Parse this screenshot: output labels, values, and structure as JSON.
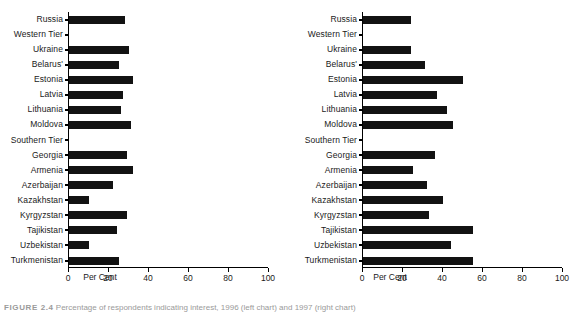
{
  "figure": {
    "caption_label": "FIGURE 2.4",
    "caption_text": "Percentage of respondents indicating interest, 1996 (left chart) and 1997 (right chart)"
  },
  "chart_data": [
    {
      "type": "bar",
      "orientation": "horizontal",
      "title": "",
      "xlabel": "Per Cent",
      "ylabel": "",
      "xlim": [
        0,
        100
      ],
      "xticks": [
        0,
        20,
        40,
        60,
        80,
        100
      ],
      "grid": false,
      "legend": "none",
      "categories": [
        "Russia",
        "Western Tier",
        "Ukraine",
        "Belarus'",
        "Estonia",
        "Latvia",
        "Lithuania",
        "Moldova",
        "Southern Tier",
        "Georgia",
        "Armenia",
        "Azerbaijan",
        "Kazakhstan",
        "Kyrgyzstan",
        "Tajikistan",
        "Uzbekistan",
        "Turkmenistan"
      ],
      "values": [
        28,
        0,
        30,
        25,
        32,
        27,
        26,
        31,
        0,
        29,
        32,
        22,
        10,
        29,
        24,
        10,
        25
      ]
    },
    {
      "type": "bar",
      "orientation": "horizontal",
      "title": "",
      "xlabel": "Per Cent",
      "ylabel": "",
      "xlim": [
        0,
        100
      ],
      "xticks": [
        0,
        20,
        40,
        60,
        80,
        100
      ],
      "grid": false,
      "legend": "none",
      "categories": [
        "Russia",
        "Western Tier",
        "Ukraine",
        "Belarus'",
        "Estonia",
        "Latvia",
        "Lithuania",
        "Moldova",
        "Southern Tier",
        "Georgia",
        "Armenia",
        "Azerbaijan",
        "Kazakhstan",
        "Kyrgyzstan",
        "Tajikistan",
        "Uzbekistan",
        "Turkmenistan"
      ],
      "values": [
        24,
        0,
        24,
        31,
        50,
        37,
        42,
        45,
        0,
        36,
        25,
        32,
        40,
        33,
        55,
        44,
        55
      ]
    }
  ]
}
